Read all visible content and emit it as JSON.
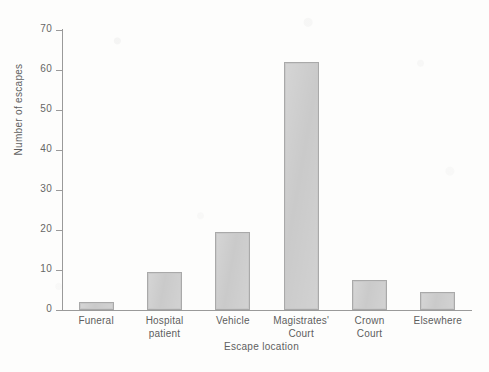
{
  "chart_data": {
    "type": "bar",
    "title": "",
    "xlabel": "Escape location",
    "ylabel": "Number of escapes",
    "categories": [
      "Funeral",
      "Hospital patient",
      "Vehicle",
      "Magistrates' Court",
      "Crown Court",
      "Elsewhere"
    ],
    "category_lines": [
      [
        "Funeral"
      ],
      [
        "Hospital",
        "patient"
      ],
      [
        "Vehicle"
      ],
      [
        "Magistrates'",
        "Court"
      ],
      [
        "Crown",
        "Court"
      ],
      [
        "Elsewhere"
      ]
    ],
    "values": [
      2,
      9.5,
      19.5,
      62,
      7.5,
      4.5
    ],
    "ylim": [
      0,
      70
    ],
    "yticks": [
      0,
      10,
      20,
      30,
      40,
      50,
      60,
      70
    ],
    "ytick_labels": [
      "0",
      "10",
      "20",
      "30",
      "40",
      "50",
      "60",
      "70"
    ],
    "grid": false,
    "legend": false,
    "bar_color": "#c9c9c9",
    "bar_border_color": "#a9a9a9",
    "axis_color": "#9a9a9a"
  }
}
